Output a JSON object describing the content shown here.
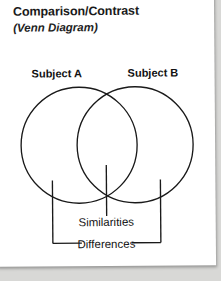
{
  "document": {
    "title": "Comparison/Contrast",
    "subtitle": "(Venn Diagram)",
    "background_color": "#ffffff",
    "ink_color": "#111111",
    "page_shadow_color": "#d8d8d6"
  },
  "diagram": {
    "type": "venn-diagram",
    "left_circle_label": "Subject A",
    "right_circle_label": "Subject B",
    "overlap_label": "Similarities",
    "outer_label": "Differences",
    "stroke_color": "#1a1a1a",
    "fill": "none",
    "circles": [
      {
        "name": "subject-a-circle",
        "cx": 83,
        "cy": 151,
        "r": 58
      },
      {
        "name": "subject-b-circle",
        "cx": 139,
        "cy": 151,
        "r": 58
      }
    ],
    "leaders": [
      {
        "name": "left-differences-stem",
        "x": 56,
        "y1": 186,
        "y2": 249
      },
      {
        "name": "center-similarities-stem",
        "x": 110,
        "y1": 171,
        "y2": 223
      },
      {
        "name": "right-differences-stem",
        "x": 164,
        "y1": 186,
        "y2": 249
      }
    ],
    "brackets": [
      {
        "name": "differences-left-arm",
        "x1": 56,
        "x2": 84,
        "y": 249
      },
      {
        "name": "differences-right-arm",
        "x1": 136,
        "x2": 164,
        "y": 249
      }
    ]
  }
}
